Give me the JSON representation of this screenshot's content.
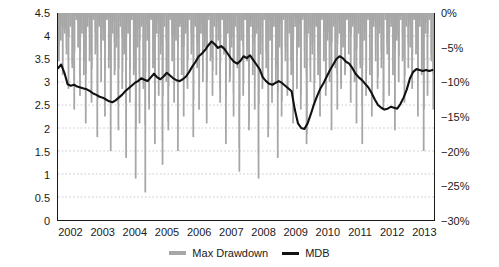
{
  "chart_data": {
    "type": "area",
    "title": "",
    "subtitle": "",
    "xlabel": "",
    "ylabel": "",
    "grid": true,
    "legend_position": "bottom-center",
    "axes": {
      "x": {
        "tick_labels": [
          "2002",
          "2003",
          "2004",
          "2005",
          "2006",
          "2007",
          "2008",
          "2009",
          "2010",
          "2011",
          "2012",
          "2013"
        ],
        "range": [
          2002,
          2013.75
        ]
      },
      "y_left": {
        "tick_labels": [
          "0",
          "0.5",
          "1",
          "1.5",
          "2",
          "2.5",
          "3",
          "3.5",
          "4",
          "4.5"
        ],
        "values": [
          0,
          0.5,
          1,
          1.5,
          2,
          2.5,
          3,
          3.5,
          4,
          4.5
        ],
        "range": [
          0,
          4.5
        ],
        "series_ref": "MDB"
      },
      "y_right": {
        "tick_labels": [
          "0%",
          "-5%",
          "-10%",
          "-15%",
          "-20%",
          "-25%",
          "-30%"
        ],
        "values": [
          0,
          -5,
          -10,
          -15,
          -20,
          -25,
          -30
        ],
        "range": [
          -30,
          0
        ],
        "series_ref": "Max Drawdown"
      }
    },
    "colors": {
      "max_drawdown": "#a6a6a6",
      "mdb_line": "#111111",
      "grid": "#b9b9c9",
      "axis": "#1a1a1a"
    },
    "series": [
      {
        "name": "Max Drawdown",
        "type": "area",
        "axis": "right",
        "unit": "%",
        "x": [
          2002.0,
          2002.06,
          2002.12,
          2002.18,
          2002.24,
          2002.3,
          2002.36,
          2002.42,
          2002.48,
          2002.54,
          2002.6,
          2002.66,
          2002.72,
          2002.78,
          2002.84,
          2002.9,
          2002.96,
          2003.02,
          2003.08,
          2003.14,
          2003.2,
          2003.26,
          2003.32,
          2003.38,
          2003.44,
          2003.5,
          2003.56,
          2003.62,
          2003.68,
          2003.74,
          2003.8,
          2003.86,
          2003.92,
          2003.98,
          2004.04,
          2004.1,
          2004.16,
          2004.22,
          2004.28,
          2004.34,
          2004.4,
          2004.46,
          2004.52,
          2004.58,
          2004.64,
          2004.7,
          2004.76,
          2004.82,
          2004.88,
          2004.94,
          2005.0,
          2005.06,
          2005.12,
          2005.18,
          2005.24,
          2005.3,
          2005.36,
          2005.42,
          2005.48,
          2005.54,
          2005.6,
          2005.66,
          2005.72,
          2005.78,
          2005.84,
          2005.9,
          2005.96,
          2006.02,
          2006.08,
          2006.14,
          2006.2,
          2006.26,
          2006.32,
          2006.38,
          2006.44,
          2006.5,
          2006.56,
          2006.62,
          2006.68,
          2006.74,
          2006.8,
          2006.86,
          2006.92,
          2006.98,
          2007.04,
          2007.1,
          2007.16,
          2007.22,
          2007.28,
          2007.34,
          2007.4,
          2007.46,
          2007.52,
          2007.58,
          2007.64,
          2007.7,
          2007.76,
          2007.82,
          2007.88,
          2007.94,
          2008.0,
          2008.06,
          2008.12,
          2008.18,
          2008.24,
          2008.3,
          2008.36,
          2008.42,
          2008.48,
          2008.54,
          2008.6,
          2008.66,
          2008.72,
          2008.78,
          2008.84,
          2008.9,
          2008.96,
          2009.02,
          2009.08,
          2009.14,
          2009.2,
          2009.26,
          2009.32,
          2009.38,
          2009.44,
          2009.5,
          2009.56,
          2009.62,
          2009.68,
          2009.74,
          2009.8,
          2009.86,
          2009.92,
          2009.98,
          2010.04,
          2010.1,
          2010.16,
          2010.22,
          2010.28,
          2010.34,
          2010.4,
          2010.46,
          2010.52,
          2010.58,
          2010.64,
          2010.7,
          2010.76,
          2010.82,
          2010.88,
          2010.94,
          2011.0,
          2011.06,
          2011.12,
          2011.18,
          2011.24,
          2011.3,
          2011.36,
          2011.42,
          2011.48,
          2011.54,
          2011.6,
          2011.66,
          2011.72,
          2011.78,
          2011.84,
          2011.9,
          2011.96,
          2012.02,
          2012.08,
          2012.14,
          2012.2,
          2012.26,
          2012.32,
          2012.38,
          2012.44,
          2012.5,
          2012.56,
          2012.62,
          2012.68,
          2012.74,
          2012.8,
          2012.86,
          2012.92,
          2012.98,
          2013.04,
          2013.1,
          2013.16,
          2013.22,
          2013.28,
          2013.34,
          2013.4,
          2013.46,
          2013.52,
          2013.58,
          2013.64,
          2013.7
        ],
        "values": [
          -7,
          -4,
          -9,
          -3,
          -6,
          -11,
          -2,
          -8,
          -14,
          -1,
          -5,
          -12,
          -3,
          -9,
          -16,
          -2,
          -7,
          -13,
          -1,
          -6,
          -18,
          -2,
          -10,
          -4,
          -15,
          -1,
          -8,
          -20,
          -3,
          -9,
          -5,
          -17,
          -2,
          -11,
          -6,
          -21,
          -3,
          -13,
          -1,
          -9,
          -24,
          -5,
          -16,
          -2,
          -11,
          -26,
          -4,
          -14,
          -1,
          -8,
          -19,
          -3,
          -12,
          -6,
          -22,
          -2,
          -10,
          -17,
          -1,
          -7,
          -13,
          -4,
          -20,
          -2,
          -9,
          -15,
          -3,
          -11,
          -1,
          -6,
          -18,
          -2,
          -8,
          -14,
          -3,
          -10,
          -5,
          -16,
          -1,
          -7,
          -12,
          -2,
          -9,
          -4,
          -13,
          -1,
          -6,
          -19,
          -3,
          -10,
          -5,
          -15,
          -2,
          -8,
          -23,
          -4,
          -12,
          -1,
          -7,
          -17,
          -2,
          -9,
          -14,
          -3,
          -24,
          -6,
          -11,
          -1,
          -8,
          -18,
          -4,
          -13,
          -2,
          -10,
          -21,
          -5,
          -15,
          -1,
          -7,
          -12,
          -3,
          -9,
          -16,
          -2,
          -11,
          -5,
          -14,
          -1,
          -8,
          -19,
          -3,
          -10,
          -6,
          -13,
          -2,
          -9,
          -15,
          -1,
          -7,
          -12,
          -4,
          -10,
          -17,
          -2,
          -8,
          -14,
          -3,
          -11,
          -5,
          -9,
          -1,
          -6,
          -13,
          -2,
          -10,
          -16,
          -3,
          -8,
          -19,
          -4,
          -12,
          -1,
          -9,
          -15,
          -2,
          -7,
          -11,
          -3,
          -8,
          -14,
          -1,
          -6,
          -12,
          -2,
          -9,
          -17,
          -4,
          -10,
          -1,
          -7,
          -13,
          -2,
          -8,
          -5,
          -11,
          -1,
          -6,
          -15,
          -2,
          -9,
          -20,
          -3,
          -12,
          -1,
          -7,
          -14
        ]
      },
      {
        "name": "MDB",
        "type": "line",
        "axis": "left",
        "x": [
          2002.0,
          2002.1,
          2002.2,
          2002.3,
          2002.4,
          2002.5,
          2002.6,
          2002.7,
          2002.8,
          2002.9,
          2003.0,
          2003.1,
          2003.2,
          2003.3,
          2003.4,
          2003.5,
          2003.6,
          2003.7,
          2003.8,
          2003.9,
          2004.0,
          2004.1,
          2004.2,
          2004.3,
          2004.4,
          2004.5,
          2004.6,
          2004.7,
          2004.8,
          2004.9,
          2005.0,
          2005.1,
          2005.2,
          2005.3,
          2005.4,
          2005.5,
          2005.6,
          2005.7,
          2005.8,
          2005.9,
          2006.0,
          2006.1,
          2006.2,
          2006.3,
          2006.4,
          2006.5,
          2006.6,
          2006.7,
          2006.8,
          2006.9,
          2007.0,
          2007.1,
          2007.2,
          2007.3,
          2007.4,
          2007.5,
          2007.6,
          2007.7,
          2007.8,
          2007.9,
          2008.0,
          2008.1,
          2008.2,
          2008.3,
          2008.4,
          2008.5,
          2008.6,
          2008.7,
          2008.8,
          2008.9,
          2009.0,
          2009.1,
          2009.2,
          2009.3,
          2009.4,
          2009.5,
          2009.6,
          2009.7,
          2009.8,
          2009.9,
          2010.0,
          2010.1,
          2010.2,
          2010.3,
          2010.4,
          2010.5,
          2010.6,
          2010.7,
          2010.8,
          2010.9,
          2011.0,
          2011.1,
          2011.2,
          2011.3,
          2011.4,
          2011.5,
          2011.6,
          2011.7,
          2011.8,
          2011.9,
          2012.0,
          2012.1,
          2012.2,
          2012.3,
          2012.4,
          2012.5,
          2012.6,
          2012.7,
          2012.8,
          2012.9,
          2013.0,
          2013.1,
          2013.2,
          2013.3,
          2013.4,
          2013.5,
          2013.6,
          2013.7
        ],
        "values": [
          3.3,
          3.38,
          3.2,
          2.95,
          2.92,
          2.94,
          2.9,
          2.88,
          2.86,
          2.84,
          2.8,
          2.75,
          2.72,
          2.68,
          2.66,
          2.62,
          2.58,
          2.56,
          2.6,
          2.66,
          2.72,
          2.8,
          2.86,
          2.92,
          2.98,
          3.02,
          3.08,
          3.05,
          3.02,
          3.1,
          3.18,
          3.1,
          3.06,
          3.12,
          3.2,
          3.14,
          3.08,
          3.04,
          3.02,
          3.06,
          3.12,
          3.22,
          3.34,
          3.44,
          3.56,
          3.62,
          3.7,
          3.8,
          3.88,
          3.82,
          3.74,
          3.78,
          3.72,
          3.62,
          3.52,
          3.44,
          3.4,
          3.46,
          3.56,
          3.52,
          3.58,
          3.48,
          3.38,
          3.28,
          3.1,
          3.02,
          2.96,
          2.94,
          2.98,
          3.02,
          2.98,
          2.92,
          2.86,
          2.8,
          2.4,
          2.1,
          2.0,
          1.98,
          2.1,
          2.3,
          2.52,
          2.7,
          2.86,
          2.98,
          3.12,
          3.26,
          3.38,
          3.5,
          3.56,
          3.52,
          3.44,
          3.4,
          3.3,
          3.18,
          3.1,
          3.04,
          2.96,
          2.88,
          2.76,
          2.62,
          2.5,
          2.44,
          2.4,
          2.42,
          2.46,
          2.44,
          2.42,
          2.52,
          2.66,
          2.84,
          3.08,
          3.22,
          3.28,
          3.26,
          3.24,
          3.26,
          3.24,
          3.26
        ]
      }
    ]
  },
  "legend": {
    "items": [
      {
        "label": "Max Drawdown",
        "marker": "area-swatch"
      },
      {
        "label": "MDB",
        "marker": "line-swatch"
      }
    ]
  }
}
